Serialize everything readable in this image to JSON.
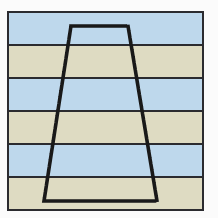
{
  "figure": {
    "name": "stratigraphy-cross-section",
    "background_color": "#fbfbfb",
    "frame": {
      "border_color": "#2b2b2f",
      "border_width_px": 2,
      "x": 7,
      "y": 11,
      "width": 197,
      "height": 200
    },
    "colors": {
      "layer_blue": "#bed8ec",
      "layer_tan": "#dedbc2",
      "line_black": "#2b2b2f",
      "dotted_outline": "#191919",
      "background": "#fbfbfb"
    }
  },
  "chart_data": {
    "type": "diagram",
    "xlabel": "",
    "ylabel": "",
    "grid": false,
    "legend": "none",
    "layers": [
      {
        "index": 1,
        "label": "Layer 1",
        "color": "#bed8ec",
        "color_name": "blue",
        "top": 0,
        "height": 31
      },
      {
        "index": 2,
        "label": "Layer 2",
        "color": "#dedbc2",
        "color_name": "tan",
        "top": 33,
        "height": 31
      },
      {
        "index": 3,
        "label": "Layer 3",
        "color": "#bed8ec",
        "color_name": "blue",
        "top": 66,
        "height": 31
      },
      {
        "index": 4,
        "label": "Layer 4",
        "color": "#dedbc2",
        "color_name": "tan",
        "top": 99,
        "height": 31
      },
      {
        "index": 5,
        "label": "Layer 5",
        "color": "#bed8ec",
        "color_name": "blue",
        "top": 132,
        "height": 31
      },
      {
        "index": 6,
        "label": "Layer 6",
        "color": "#dedbc2",
        "color_name": "tan",
        "top": 165,
        "height": 31
      }
    ],
    "dividers": [
      32,
      65,
      98,
      131,
      164
    ],
    "outline_shape": {
      "name": "dotted-trapezoid",
      "style": "dotted",
      "closed": true,
      "points": [
        [
          71,
          26
        ],
        [
          128,
          26
        ],
        [
          157,
          201
        ],
        [
          44,
          201
        ]
      ]
    }
  }
}
